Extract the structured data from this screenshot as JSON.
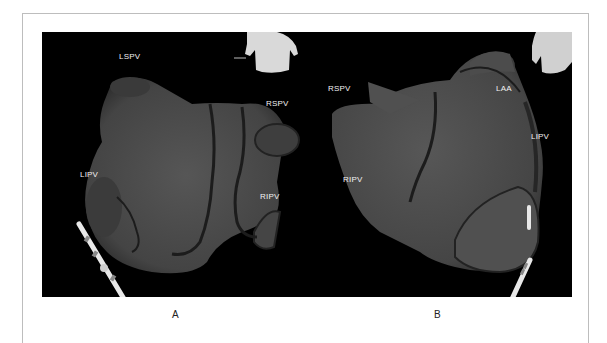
{
  "figure": {
    "panels": [
      {
        "id": "A",
        "caption": "A",
        "labels": {
          "lspv": "LSPV",
          "rspv": "RSPV",
          "lipv": "LIPV",
          "ripv": "RIPV"
        },
        "view": "posterior torso orientation icon"
      },
      {
        "id": "B",
        "caption": "B",
        "labels": {
          "rspv": "RSPV",
          "laa": "LAA",
          "lipv": "LIPV",
          "ripv": "RIPV"
        },
        "view": "posterior torso orientation icon"
      }
    ],
    "colors": {
      "background": "#000000",
      "surface": "#4a4a4a",
      "outline": "#2a2a2a",
      "label": "#f2f2f2",
      "frame": "#bdbdbd"
    }
  }
}
